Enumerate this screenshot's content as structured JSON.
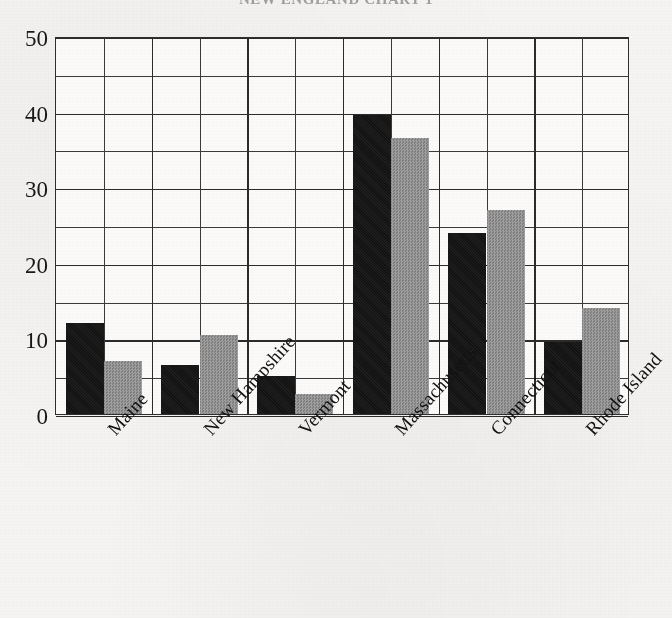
{
  "chart_data": {
    "type": "bar",
    "title": "NEW ENGLAND CHART 1",
    "xlabel": "",
    "ylabel": "",
    "ylim": [
      0,
      50
    ],
    "yticks": [
      0,
      10,
      20,
      30,
      40,
      50
    ],
    "ytick_labels": [
      "0",
      "10",
      "20",
      "30",
      "40",
      "50"
    ],
    "minor_tick_step": 5,
    "grid": true,
    "legend": "none",
    "categories": [
      "Maine",
      "New Hampshire",
      "Vermont",
      "Massachusetts",
      "Connecticut",
      "Rhode Island"
    ],
    "series": [
      {
        "name": "Series 1",
        "color": "#121212",
        "values": [
          12.0,
          6.5,
          5.0,
          39.5,
          24.0,
          9.5
        ]
      },
      {
        "name": "Series 2",
        "color": "#8d8d8d",
        "values": [
          7.0,
          10.5,
          2.7,
          36.5,
          27.0,
          14.0
        ]
      }
    ]
  },
  "axis": {
    "frame_color": "#2e2e2e",
    "grid_color": "#3a3a3a",
    "plot_background": "#fbfaf8",
    "page_background": "#f5f4f2"
  }
}
